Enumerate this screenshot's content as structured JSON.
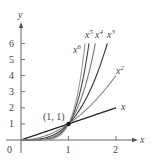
{
  "chart_data": {
    "type": "line",
    "title": "",
    "xlabel": "x",
    "ylabel": "y",
    "xlim": [
      0,
      2.3
    ],
    "ylim": [
      0,
      7
    ],
    "x_ticks": [
      "0",
      "1",
      "2"
    ],
    "y_ticks": [
      "1",
      "2",
      "3",
      "4",
      "5",
      "6"
    ],
    "grid": false,
    "legend": "inline labels at curve ends",
    "series": [
      {
        "name": "x",
        "label": "x",
        "power": 1,
        "x": [
          0,
          0.5,
          1,
          1.5,
          2
        ],
        "values": [
          0,
          0.5,
          1,
          1.5,
          2
        ],
        "color": "#222222"
      },
      {
        "name": "x^2",
        "label": "x",
        "sup": "2",
        "power": 2,
        "x": [
          0,
          0.5,
          1,
          1.5,
          2
        ],
        "values": [
          0,
          0.25,
          1,
          2.25,
          4
        ],
        "color": "#888888"
      },
      {
        "name": "x^3",
        "label": "x",
        "sup": "3",
        "power": 3,
        "x": [
          0,
          0.5,
          1,
          1.5,
          1.82
        ],
        "values": [
          0,
          0.125,
          1,
          3.375,
          6
        ],
        "color": "#333333"
      },
      {
        "name": "x^4",
        "label": "x",
        "sup": "4",
        "power": 4,
        "x": [
          0,
          0.5,
          1,
          1.25,
          1.57
        ],
        "values": [
          0,
          0.0625,
          1,
          2.44,
          6
        ],
        "color": "#777777"
      },
      {
        "name": "x^5",
        "label": "x",
        "sup": "5",
        "power": 5,
        "x": [
          0,
          0.5,
          1,
          1.2,
          1.43
        ],
        "values": [
          0,
          0.03125,
          1,
          2.49,
          6
        ],
        "color": "#444444"
      },
      {
        "name": "x^6",
        "label": "x",
        "sup": "6",
        "power": 6,
        "x": [
          0,
          0.5,
          1,
          1.2,
          1.35
        ],
        "values": [
          0,
          0.015625,
          1,
          2.99,
          6
        ],
        "color": "#999999"
      }
    ],
    "annotations": [
      {
        "text": "(1, 1)",
        "x": 1,
        "y": 1,
        "marker": "filled-dot"
      }
    ]
  },
  "labels": {
    "x_axis": "x",
    "y_axis": "y",
    "origin": "0",
    "point": "(1, 1)",
    "curve_base": "x"
  }
}
